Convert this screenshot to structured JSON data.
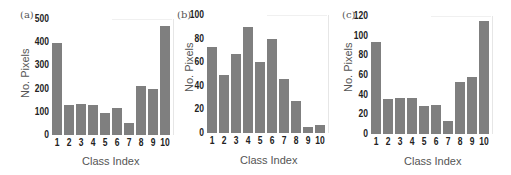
{
  "chart_data": [
    {
      "type": "bar",
      "panel": "(a)",
      "title": "",
      "xlabel": "Class Index",
      "ylabel": "No. Pixels",
      "categories": [
        "1",
        "2",
        "3",
        "4",
        "5",
        "6",
        "7",
        "8",
        "9",
        "10"
      ],
      "values": [
        395,
        130,
        135,
        128,
        96,
        117,
        52,
        213,
        200,
        470
      ],
      "ylim": [
        0,
        500
      ],
      "yticks": [
        "0",
        "100",
        "200",
        "300",
        "400",
        "500"
      ],
      "grid": false,
      "bar_color": "#7f7f7f"
    },
    {
      "type": "bar",
      "panel": "(b)",
      "title": "",
      "xlabel": "Class Index",
      "ylabel": "No. Pixels",
      "categories": [
        "1",
        "2",
        "3",
        "4",
        "5",
        "6",
        "7",
        "8",
        "9",
        "10"
      ],
      "values": [
        73,
        49,
        67,
        90,
        60,
        80,
        46,
        27,
        5,
        7
      ],
      "ylim": [
        0,
        100
      ],
      "yticks": [
        "0",
        "20",
        "40",
        "60",
        "80",
        "100"
      ],
      "grid": false,
      "bar_color": "#7f7f7f"
    },
    {
      "type": "bar",
      "panel": "(c)",
      "title": "",
      "xlabel": "Class Index",
      "ylabel": "No. Pixels",
      "categories": [
        "1",
        "2",
        "3",
        "4",
        "5",
        "6",
        "7",
        "8",
        "9",
        "10"
      ],
      "values": [
        94,
        36,
        37,
        37,
        28,
        30,
        13,
        53,
        58,
        115
      ],
      "ylim": [
        0,
        120
      ],
      "yticks": [
        "0",
        "20",
        "40",
        "60",
        "80",
        "100",
        "120"
      ],
      "grid": false,
      "bar_color": "#7f7f7f"
    }
  ],
  "panels": [
    {
      "label": "(a)",
      "xlabel": "Class Index",
      "ylabel": "No. Pixels"
    },
    {
      "label": "(b)",
      "xlabel": "Class Index",
      "ylabel": "No. Pixels"
    },
    {
      "label": "(c)",
      "xlabel": "Class Index",
      "ylabel": "No. Pixels"
    }
  ]
}
